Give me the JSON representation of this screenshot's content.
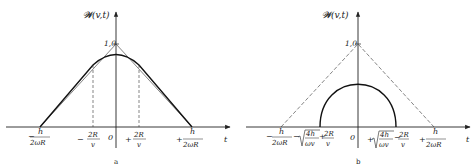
{
  "figure": {
    "panels": [
      {
        "caption": "a",
        "y_axis_label": "𝓦(v,t)",
        "x_axis_label": "t",
        "peak_label": "1,0",
        "origin_label": "0",
        "ticks": {
          "left_outer": {
            "sign": "−",
            "num": "h",
            "den": "2ωR"
          },
          "left_inner": {
            "sign": "−",
            "num": "2R",
            "den": "v"
          },
          "right_inner": {
            "sign": "+",
            "num": "2R",
            "den": "v"
          },
          "right_outer": {
            "sign": "+",
            "num": "h",
            "den": "2ωR"
          }
        }
      },
      {
        "caption": "b",
        "y_axis_label": "𝓦(v,t)",
        "x_axis_label": "t",
        "peak_label": "1,0",
        "origin_label": "0",
        "ticks": {
          "left_outer": {
            "sign": "−",
            "num": "h",
            "den": "2ωR"
          },
          "left_inner": {
            "sign": "−",
            "sqrt_num": "4h",
            "sqrt_den": "ωv",
            "op": "+",
            "num": "2R",
            "den": "v"
          },
          "right_inner": {
            "sign": "+",
            "sqrt_num": "4h",
            "sqrt_den": "ωv",
            "op": "−",
            "num": "2R",
            "den": "v"
          },
          "right_outer": {
            "sign": "+",
            "num": "h",
            "den": "2ωR"
          }
        }
      }
    ]
  },
  "colors": {
    "ink": "#222222",
    "background": "#ffffff"
  }
}
